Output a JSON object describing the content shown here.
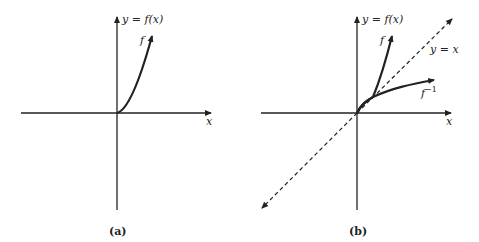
{
  "figure": {
    "panels": [
      {
        "id": "a",
        "caption": "(a)",
        "y_axis_label": "y = f(x)",
        "x_axis_label": "x",
        "curves": [
          {
            "name": "f",
            "label": "f",
            "description": "increasing curve from origin, concave up"
          }
        ]
      },
      {
        "id": "b",
        "caption": "(b)",
        "y_axis_label": "y = f(x)",
        "x_axis_label": "x",
        "curves": [
          {
            "name": "f",
            "label": "f",
            "description": "increasing curve from origin, concave up"
          },
          {
            "name": "f-inverse",
            "label": "f",
            "superscript": "−1",
            "description": "reflection of f across y = x"
          },
          {
            "name": "identity-line",
            "label": "y = x",
            "style": "dashed"
          }
        ]
      }
    ],
    "colors": {
      "line": "#222222",
      "background": "#ffffff"
    }
  }
}
